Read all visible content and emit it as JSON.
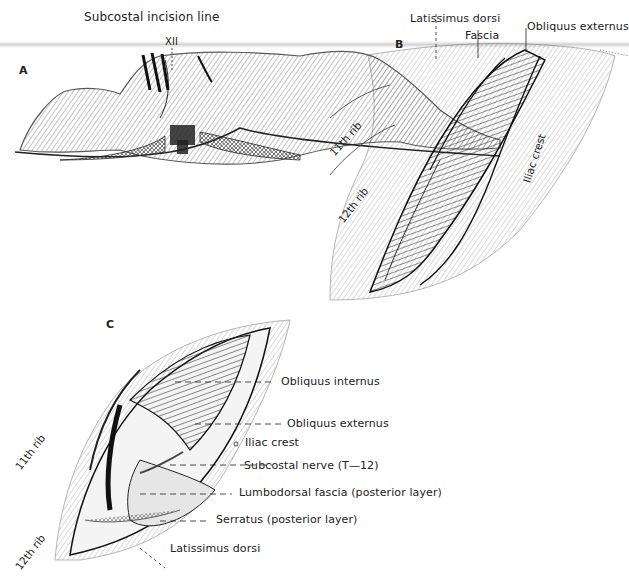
{
  "figure": {
    "panels": [
      {
        "id": "A",
        "letter": "A",
        "title_label": "Subcostal incision line",
        "labels": {
          "vertebra": "XII"
        }
      },
      {
        "id": "B",
        "letter": "B",
        "labels": {
          "latissimus_dorsi": "Latissimus dorsi",
          "fascia": "Fascia",
          "obliquus_externus": "Obliquus externus",
          "rib_11": "11th rib",
          "rib_12": "12th rib",
          "iliac_crest": "Iliac crest"
        }
      },
      {
        "id": "C",
        "letter": "C",
        "labels": {
          "obliquus_internus": "Obliquus internus",
          "obliquus_externus": "Obliquus externus",
          "iliac_crest": "Iliac crest",
          "subcostal_nerve": "Subcostal nerve (T—12)",
          "lumbodorsal_fascia": "Lumbodorsal fascia (posterior layer)",
          "serratus": "Serratus (posterior layer)",
          "latissimus_dorsi": "Latissimus dorsi",
          "rib_11": "11th rib",
          "rib_12": "12th rib"
        }
      }
    ],
    "colors": {
      "ink": "#1a1a1a",
      "paper": "#ffffff",
      "band": "#d4d4d4"
    }
  }
}
